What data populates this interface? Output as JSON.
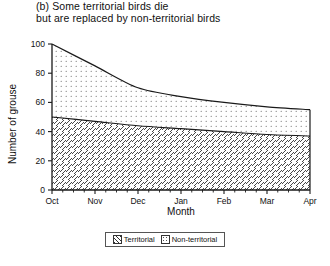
{
  "figure": {
    "caption_lines": [
      "(b) Some territorial birds die",
      "but are replaced by non-territorial birds"
    ]
  },
  "legend": {
    "entries": [
      {
        "label": "Territorial",
        "pattern": "diagonal-hatch",
        "swatch_name": "territorial-swatch"
      },
      {
        "label": "Non-territorial",
        "pattern": "dotted",
        "swatch_name": "non-territorial-swatch"
      }
    ]
  },
  "chart_data": {
    "type": "area",
    "title": "(b) Some territorial birds die but are replaced by non-territorial birds",
    "xlabel": "Month",
    "ylabel": "Number of grouse",
    "categories": [
      "Oct",
      "Nov",
      "Dec",
      "Jan",
      "Feb",
      "Mar",
      "Apr"
    ],
    "xtick_labels": [
      "Oct",
      "Nov",
      "Dec",
      "Jan",
      "Feb",
      "Mar",
      "Apr"
    ],
    "ytick_labels": [
      "0",
      "20",
      "40",
      "60",
      "80",
      "100"
    ],
    "ytick_values": [
      0,
      20,
      40,
      60,
      80,
      100
    ],
    "ylim": [
      0,
      100
    ],
    "xlim": [
      0,
      6
    ],
    "grid": false,
    "legend_position": "below-axes",
    "stacked": true,
    "series": [
      {
        "name": "Territorial",
        "pattern": "diagonal-hatch",
        "values": [
          50,
          47,
          44,
          42,
          40,
          38,
          37
        ]
      },
      {
        "name": "Non-territorial",
        "pattern": "dotted",
        "values": [
          50,
          38,
          26,
          22,
          20,
          19,
          18
        ]
      }
    ],
    "total_line": {
      "name": "Total number of grouse",
      "values": [
        100,
        85,
        70,
        64,
        60,
        57,
        55
      ]
    },
    "annotations": []
  }
}
